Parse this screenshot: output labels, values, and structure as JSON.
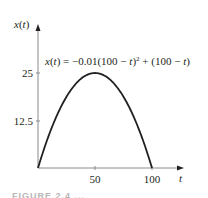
{
  "chart_data": {
    "type": "line",
    "title": "",
    "equation": "x(t) = −0.01(100 − t)² + (100 − t)",
    "equation_parts": {
      "lhs": "x(t) = −0.01(100 − t)",
      "exp": "2",
      "rhs": " + (100 − t)"
    },
    "xlabel": "t",
    "ylabel": "x(t)",
    "xlim": [
      0,
      105
    ],
    "ylim": [
      0,
      30
    ],
    "xticks": [
      50,
      100
    ],
    "xtick_labels": [
      "50",
      "100"
    ],
    "yticks": [
      12.5,
      25
    ],
    "ytick_labels": [
      "12.5",
      "25"
    ],
    "grid": false,
    "series": [
      {
        "name": "x(t)",
        "x": [
          0,
          10,
          20,
          30,
          40,
          50,
          60,
          70,
          80,
          90,
          100
        ],
        "y": [
          0,
          9,
          16,
          21,
          24,
          25,
          24,
          21,
          16,
          9,
          0
        ]
      }
    ],
    "colors": {
      "curve": "#231f20",
      "axis": "#808080"
    }
  },
  "caption": "FIGURE 2.4 ..."
}
